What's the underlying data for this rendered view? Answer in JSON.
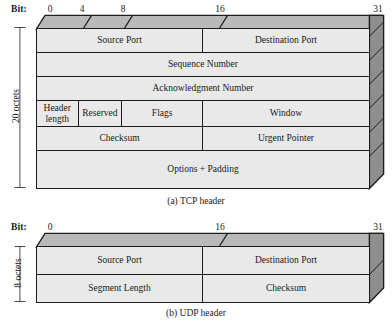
{
  "figure": {
    "title_tcp_caption": "(a) TCP header",
    "title_udp_caption": "(b) UDP header",
    "bit_axis_label": "Bit:",
    "colors": {
      "cell_fill": "#e9e9e9",
      "top_face": "#b9b9b9",
      "side_face": "#8e8e8e",
      "outline": "#1d1d1d",
      "background": "#ffffff"
    }
  },
  "tcp": {
    "bit_ticks": [
      {
        "label": "0",
        "bit": 0
      },
      {
        "label": "4",
        "bit": 4
      },
      {
        "label": "8",
        "bit": 8
      },
      {
        "label": "16",
        "bit": 16
      },
      {
        "label": "31",
        "bit": 31
      }
    ],
    "size_label": "20 octets",
    "rows": [
      {
        "cells": [
          {
            "label": "Source Port",
            "bits": 16
          },
          {
            "label": "Destination Port",
            "bits": 16
          }
        ]
      },
      {
        "cells": [
          {
            "label": "Sequence Number",
            "bits": 32
          }
        ]
      },
      {
        "cells": [
          {
            "label": "Acknowledgment Number",
            "bits": 32
          }
        ]
      },
      {
        "cells": [
          {
            "label": "Header length",
            "bits": 4
          },
          {
            "label": "Reserved",
            "bits": 6
          },
          {
            "label": "Flags",
            "bits": 6
          },
          {
            "label": "Window",
            "bits": 16
          }
        ]
      },
      {
        "cells": [
          {
            "label": "Checksum",
            "bits": 16
          },
          {
            "label": "Urgent Pointer",
            "bits": 16
          }
        ]
      },
      {
        "cells": [
          {
            "label": "Options + Padding",
            "bits": 32
          }
        ]
      }
    ]
  },
  "udp": {
    "bit_ticks": [
      {
        "label": "0",
        "bit": 0
      },
      {
        "label": "16",
        "bit": 16
      },
      {
        "label": "31",
        "bit": 31
      }
    ],
    "size_label": "8 octets",
    "rows": [
      {
        "cells": [
          {
            "label": "Source Port",
            "bits": 16
          },
          {
            "label": "Destination Port",
            "bits": 16
          }
        ]
      },
      {
        "cells": [
          {
            "label": "Segment Length",
            "bits": 16
          },
          {
            "label": "Checksum",
            "bits": 16
          }
        ]
      }
    ]
  }
}
